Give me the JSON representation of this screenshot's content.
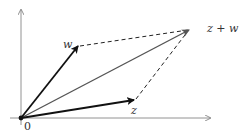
{
  "diagram": {
    "origin_label": "0",
    "labels": {
      "w": "w",
      "z": "z",
      "sum": "z + w"
    },
    "points": {
      "origin": [
        21,
        118
      ],
      "w": [
        78,
        46
      ],
      "z": [
        134,
        100
      ],
      "sum": [
        190,
        29
      ]
    },
    "colors": {
      "vector": "#111111",
      "sum_vector": "#555555",
      "axis": "#777777",
      "dashed": "#222222"
    }
  }
}
